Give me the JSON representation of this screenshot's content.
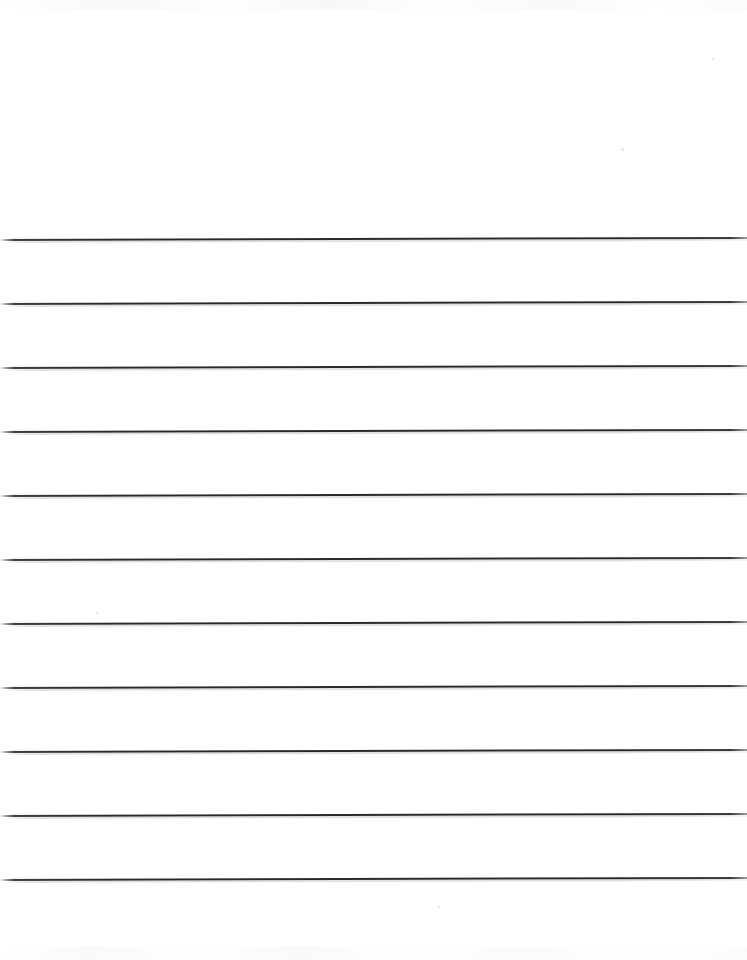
{
  "document": {
    "kind": "scanned-lined-paper",
    "title": "Blank Lined Notebook Page",
    "page_width": 747,
    "page_height": 960,
    "background_color": "#fefefe",
    "has_text": false,
    "has_handwriting": false,
    "has_margin_rule": false,
    "has_punch_holes": false,
    "body_text": "",
    "header_text": "",
    "footer_text": ""
  },
  "ruling": {
    "line_color": "#2a2a2e",
    "line_count": 11,
    "line_thickness_px": 2,
    "line_spacing_px": 64,
    "first_line_y": 239,
    "last_line_y": 879,
    "skew_degrees": -0.16,
    "top_margin_px": 239,
    "bottom_margin_px": 81,
    "line_positions_y": [
      239,
      303,
      367,
      431,
      495,
      559,
      623,
      687,
      751,
      815,
      879
    ]
  },
  "artifacts": {
    "specks": [
      {
        "x": 621,
        "y": 148,
        "size": 3
      },
      {
        "x": 96,
        "y": 612,
        "size": 2
      },
      {
        "x": 438,
        "y": 906,
        "size": 2
      },
      {
        "x": 712,
        "y": 58,
        "size": 2
      }
    ],
    "noise_band_top_height": 10,
    "noise_band_bottom_height": 14
  }
}
